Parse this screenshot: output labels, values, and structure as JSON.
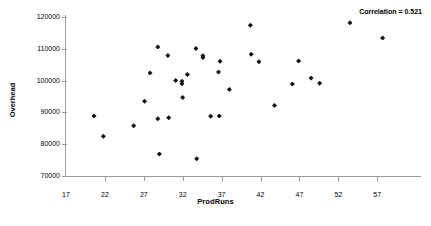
{
  "chart_data": {
    "type": "scatter",
    "title": "",
    "xlabel": "ProdRuns",
    "ylabel": "Overhead",
    "xlim": [
      17,
      62
    ],
    "ylim": [
      70000,
      120000
    ],
    "xticks": [
      17,
      22,
      27,
      32,
      37,
      42,
      47,
      52,
      57
    ],
    "yticks": [
      70000,
      80000,
      90000,
      100000,
      110000,
      120000
    ],
    "xtick_labels": [
      "17",
      "22",
      "27",
      "32",
      "37",
      "42",
      "47",
      "52",
      "57"
    ],
    "ytick_labels": [
      "70000",
      "80000",
      "90000",
      "100000",
      "110000",
      "120000"
    ],
    "grid": false,
    "legend": null,
    "annotations": [
      {
        "text": "Correlation = 0.521",
        "position": "top-right"
      }
    ],
    "marker": {
      "shape": "diamond",
      "color": "#111111",
      "size": 5
    },
    "points": [
      {
        "x": 20.6,
        "y": 88900
      },
      {
        "x": 21.8,
        "y": 82500
      },
      {
        "x": 25.7,
        "y": 85800
      },
      {
        "x": 27.1,
        "y": 93500
      },
      {
        "x": 27.8,
        "y": 102400
      },
      {
        "x": 28.8,
        "y": 110600
      },
      {
        "x": 28.8,
        "y": 88000
      },
      {
        "x": 29.0,
        "y": 76900
      },
      {
        "x": 30.1,
        "y": 107900
      },
      {
        "x": 30.2,
        "y": 88300
      },
      {
        "x": 31.1,
        "y": 100000
      },
      {
        "x": 31.9,
        "y": 99000
      },
      {
        "x": 31.9,
        "y": 99800
      },
      {
        "x": 32.0,
        "y": 94700
      },
      {
        "x": 32.6,
        "y": 101900
      },
      {
        "x": 33.7,
        "y": 110100
      },
      {
        "x": 33.8,
        "y": 75400
      },
      {
        "x": 34.6,
        "y": 107300
      },
      {
        "x": 34.6,
        "y": 107800
      },
      {
        "x": 35.6,
        "y": 88800
      },
      {
        "x": 36.6,
        "y": 102700
      },
      {
        "x": 36.7,
        "y": 88900
      },
      {
        "x": 36.8,
        "y": 106100
      },
      {
        "x": 38.0,
        "y": 97200
      },
      {
        "x": 40.7,
        "y": 117400
      },
      {
        "x": 40.8,
        "y": 108300
      },
      {
        "x": 41.8,
        "y": 105900
      },
      {
        "x": 43.8,
        "y": 92200
      },
      {
        "x": 46.1,
        "y": 98900
      },
      {
        "x": 46.9,
        "y": 106200
      },
      {
        "x": 48.5,
        "y": 100800
      },
      {
        "x": 49.6,
        "y": 99200
      },
      {
        "x": 53.5,
        "y": 118200
      },
      {
        "x": 57.7,
        "y": 113400
      }
    ]
  },
  "axes": {
    "x_title": "ProdRuns",
    "y_title": "Overhead"
  },
  "annotation": {
    "correlation_label": "Correlation = 0.521"
  }
}
